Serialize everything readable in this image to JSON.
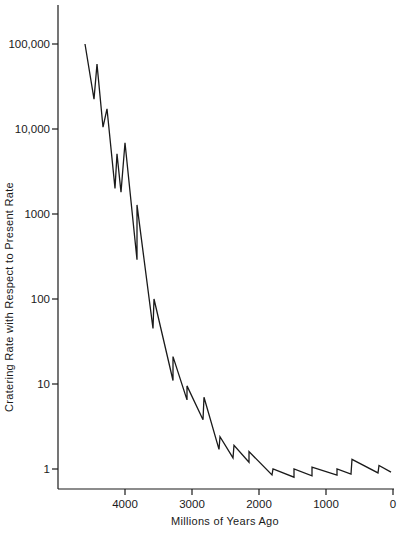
{
  "chart_data": {
    "type": "line",
    "title": "",
    "xlabel": "Millions of Years Ago",
    "ylabel": "Cratering Rate with Respect to Present Rate",
    "x_reversed": true,
    "xlim": [
      4950,
      0
    ],
    "yscale": "log",
    "ylim": [
      0.5,
      200000
    ],
    "grid": false,
    "legend": null,
    "x_ticks": [
      4000,
      3000,
      2000,
      1000,
      0
    ],
    "x_tick_labels": [
      "4000",
      "3000",
      "2000",
      "1000",
      "0"
    ],
    "y_ticks": [
      1,
      10,
      100,
      1000,
      10000,
      100000
    ],
    "y_tick_labels": [
      "1",
      "10",
      "100",
      "1000",
      "10,000",
      "100,000"
    ],
    "series": [
      {
        "name": "Cratering rate",
        "x": [
          4597,
          4463,
          4418,
          4328,
          4269,
          4149,
          4119,
          4060,
          4000,
          3821,
          3821,
          3582,
          3567,
          3284,
          3284,
          3075,
          3075,
          2836,
          2821,
          2597,
          2582,
          2388,
          2373,
          2149,
          2149,
          1806,
          1791,
          1478,
          1478,
          1209,
          1209,
          836,
          836,
          627,
          612,
          224,
          209,
          30
        ],
        "values": [
          100000,
          22500,
          58000,
          10500,
          17300,
          2000,
          5100,
          1800,
          6900,
          290,
          1280,
          45,
          100,
          11,
          21,
          6.5,
          9.5,
          3.8,
          7,
          1.7,
          2.4,
          1.35,
          1.9,
          1.2,
          1.6,
          0.85,
          1.0,
          0.8,
          1.0,
          0.83,
          1.05,
          0.85,
          1.0,
          0.87,
          1.3,
          0.9,
          1.1,
          0.92
        ]
      }
    ]
  },
  "layout": {
    "line_color": "#1a1a1a",
    "axis_color": "#1a1a1a"
  }
}
